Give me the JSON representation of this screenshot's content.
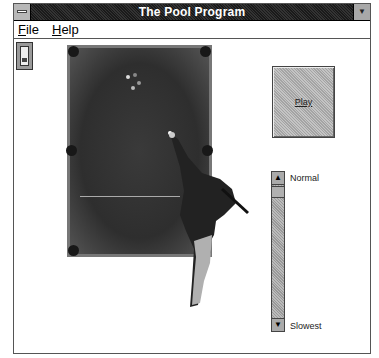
{
  "window": {
    "title": "The Pool Program"
  },
  "menu": {
    "items": [
      {
        "label_ul": "F",
        "label_rest": "ile"
      },
      {
        "label_ul": "H",
        "label_rest": "elp"
      }
    ]
  },
  "toolbar": {
    "icon": "light-switch-icon"
  },
  "play_button": {
    "label": "Play"
  },
  "speed": {
    "top_label": "Normal",
    "bottom_label": "Slowest"
  }
}
